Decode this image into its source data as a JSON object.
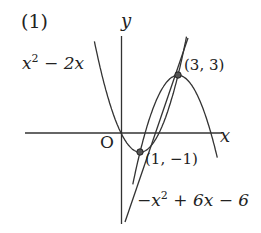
{
  "figure": {
    "problem_label": "(1)",
    "axes": {
      "x_label": "x",
      "y_label": "y",
      "origin_label": "O"
    },
    "curves": [
      {
        "name": "upward-parabola",
        "label_base": "x",
        "label_exp": "2",
        "label_rest": " − 2x",
        "equation": "y = x^2 - 2x"
      },
      {
        "name": "downward-parabola",
        "label_prefix": "−x",
        "label_exp": "2",
        "label_rest": " + 6x − 6",
        "equation": "y = -x^2 + 6x - 6"
      },
      {
        "name": "line",
        "equation": "y = 2x - 3"
      }
    ],
    "points": [
      {
        "label": "(3, 3)",
        "x": 3,
        "y": 3
      },
      {
        "label": "(1, −1)",
        "x": 1,
        "y": -1
      }
    ],
    "colors": {
      "stroke": "#333333",
      "point_fill": "#555555",
      "background": "#ffffff"
    }
  }
}
